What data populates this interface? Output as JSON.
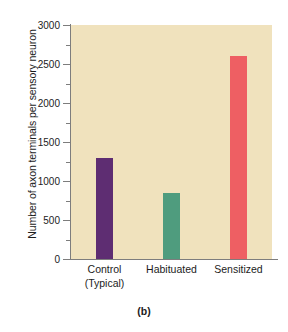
{
  "chart_data": {
    "type": "bar",
    "title": "",
    "caption": "(b)",
    "xlabel": "",
    "ylabel": "Number of axon terminals per sensory neuron",
    "categories": [
      "Control (Typical)",
      "Habituated",
      "Sensitized"
    ],
    "category_lines": [
      [
        "Control",
        "(Typical)"
      ],
      [
        "Habituated",
        ""
      ],
      [
        "Sensitized",
        ""
      ]
    ],
    "values": [
      1300,
      850,
      2600
    ],
    "bar_colors": [
      "#5e2d72",
      "#4f9c7e",
      "#ee5f63"
    ],
    "ylim": [
      0,
      3000
    ],
    "ytick_labels": [
      "0",
      "500",
      "1000",
      "1500",
      "2000",
      "2500",
      "3000"
    ],
    "ytick_values": [
      0,
      500,
      1000,
      1500,
      2000,
      2500,
      3000
    ],
    "yminor_values": [
      250,
      750,
      1250,
      1750,
      2250,
      2750
    ],
    "grid": false,
    "legend": "none",
    "plot_background": "#f0e2bd",
    "axis_color": "#7d7d7d",
    "page_background": "#ffffff"
  }
}
